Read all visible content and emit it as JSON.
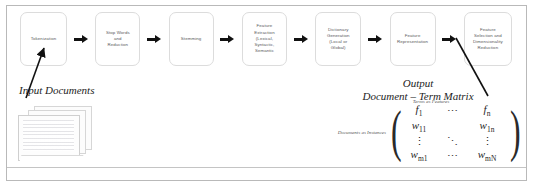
{
  "pipeline": {
    "stages": [
      {
        "label": "Tokenization"
      },
      {
        "label": "Stop Words\nand\nReduction"
      },
      {
        "label": "Stemming"
      },
      {
        "label": "Feature\nExtraction\n(Lexical,\nSyntactic,\nSemantic"
      },
      {
        "label": "Dictionary\nGeneration\n(Local or\nGlobal)"
      },
      {
        "label": "Feature\nRepresentation"
      },
      {
        "label": "Feature\nSelection and\nDimensionality\nReduction"
      }
    ],
    "arrow_icon": "right-arrow-icon"
  },
  "input": {
    "label": "Input Documents",
    "stack_icon": "document-stack-icon"
  },
  "output": {
    "title": "Output\nDocument – Term Matrix",
    "columns_label": "Terms as Features",
    "rows_label": "Documents as Instances",
    "matrix": {
      "open_bracket": "(",
      "close_bracket": ")",
      "rows": [
        [
          "f1",
          "⋯",
          "fn"
        ],
        [
          "w11",
          "",
          "w1n"
        ],
        [
          "⋮",
          "⋱",
          "⋮"
        ],
        [
          "wm1",
          "⋯",
          "wmN"
        ]
      ],
      "cells": {
        "f1": {
          "base": "f",
          "sub": "1"
        },
        "fn": {
          "base": "f",
          "sub": "n"
        },
        "w11": {
          "base": "w",
          "sub": "11"
        },
        "w1n": {
          "base": "w",
          "sub": "1n"
        },
        "wm1": {
          "base": "w",
          "sub": "m1"
        },
        "wmN": {
          "base": "w",
          "sub": "mN"
        },
        "hdots": "⋯",
        "vdots": "⋮",
        "ddots": "⋱"
      }
    }
  },
  "colors": {
    "frame": "#b9b9b9",
    "stage_border": "#dcdcdc",
    "stage_text": "#59595b",
    "arrow": "#111111",
    "serif_text": "#1d1d1d",
    "background": "#ffffff"
  }
}
